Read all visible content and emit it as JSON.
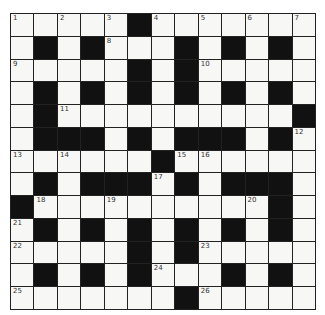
{
  "puzzle": {
    "type": "crossword",
    "size": 13,
    "legend": {
      "B": "black",
      "W": "white"
    },
    "rows": [
      [
        "1",
        "W",
        "2",
        "W",
        "3",
        "B",
        "4",
        "W",
        "5",
        "W",
        "6",
        "W",
        "7"
      ],
      [
        "W",
        "B",
        "W",
        "B",
        "8",
        "W",
        "W",
        "B",
        "W",
        "B",
        "W",
        "B",
        "W"
      ],
      [
        "9",
        "W",
        "W",
        "W",
        "W",
        "B",
        "W",
        "B",
        "10",
        "W",
        "W",
        "W",
        "W"
      ],
      [
        "W",
        "B",
        "W",
        "B",
        "W",
        "B",
        "W",
        "B",
        "W",
        "B",
        "W",
        "B",
        "W"
      ],
      [
        "W",
        "B",
        "11",
        "W",
        "W",
        "W",
        "W",
        "W",
        "W",
        "W",
        "W",
        "W",
        "B"
      ],
      [
        "W",
        "B",
        "B",
        "B",
        "W",
        "B",
        "W",
        "B",
        "B",
        "B",
        "W",
        "B",
        "12"
      ],
      [
        "13",
        "W",
        "14",
        "W",
        "W",
        "W",
        "B",
        "15",
        "16",
        "W",
        "W",
        "W",
        "W"
      ],
      [
        "W",
        "B",
        "W",
        "B",
        "B",
        "B",
        "17",
        "B",
        "W",
        "B",
        "B",
        "B",
        "W"
      ],
      [
        "B",
        "18",
        "W",
        "W",
        "19",
        "W",
        "W",
        "W",
        "W",
        "W",
        "20",
        "B",
        "W"
      ],
      [
        "21",
        "B",
        "W",
        "B",
        "W",
        "B",
        "W",
        "B",
        "W",
        "B",
        "W",
        "B",
        "W"
      ],
      [
        "22",
        "W",
        "W",
        "W",
        "W",
        "B",
        "W",
        "B",
        "23",
        "W",
        "W",
        "W",
        "W"
      ],
      [
        "W",
        "B",
        "W",
        "B",
        "W",
        "B",
        "24",
        "W",
        "W",
        "B",
        "W",
        "B",
        "W"
      ],
      [
        "25",
        "W",
        "W",
        "W",
        "W",
        "W",
        "W",
        "B",
        "26",
        "W",
        "W",
        "W",
        "W"
      ]
    ]
  }
}
